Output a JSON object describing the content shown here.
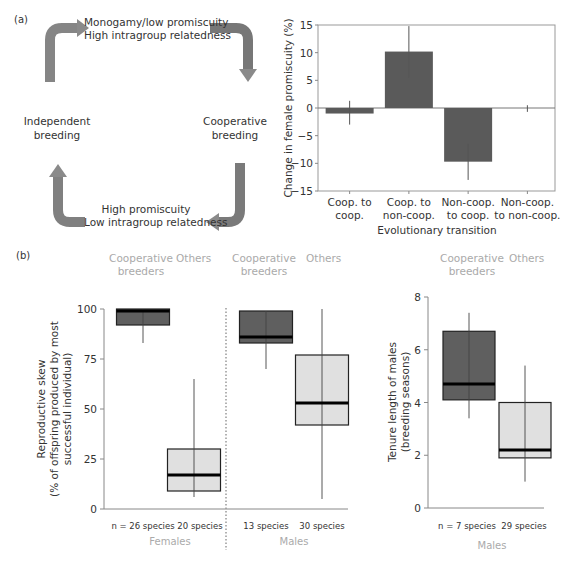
{
  "panel_a": {
    "label": "(a)",
    "diagram": {
      "top_text_line1": "Monogamy/low promiscuity",
      "top_text_line2": "High intragroup relatedness",
      "left_text_line1": "Independent",
      "left_text_line2": "breeding",
      "right_text_line1": "Cooperative",
      "right_text_line2": "breeding",
      "bottom_text_line1": "High promiscuity",
      "bottom_text_line2": "Low intragroup relatedness",
      "arrow_color": "#7f7f7f"
    }
  },
  "panel_b": {
    "label": "(b)",
    "group_headers": {
      "coop_line1": "Cooperative",
      "coop_line2": "breeders",
      "others": "Others"
    },
    "sex_labels": {
      "females": "Females",
      "males": "Males"
    },
    "skew_counts": [
      "n = 26 species",
      "20 species",
      "13 species",
      "30 species"
    ],
    "tenure_counts": [
      "n = 7 species",
      "29 species"
    ]
  },
  "chart_data": [
    {
      "type": "bar",
      "title": "",
      "xlabel": "Evolutionary transition",
      "ylabel": "Change in female promiscuity (%)",
      "categories": [
        "Coop. to coop.",
        "Coop. to non-coop.",
        "Non-coop. to coop.",
        "Non-coop. to non-coop."
      ],
      "category_lines": [
        [
          "Coop. to",
          "coop."
        ],
        [
          "Coop. to",
          "non-coop."
        ],
        [
          "Non-coop.",
          "to coop."
        ],
        [
          "Non-coop.",
          "to non-coop."
        ]
      ],
      "values": [
        -1,
        10.2,
        -9.7,
        0
      ],
      "error_low": [
        -3,
        5.5,
        -13,
        -0.7
      ],
      "error_high": [
        1.3,
        14.8,
        -6.5,
        0.5
      ],
      "ylim": [
        -15,
        15
      ],
      "yticks": [
        15,
        10,
        5,
        0,
        -5,
        -10,
        -15
      ],
      "bar_color": "#5a5a5a"
    },
    {
      "type": "box",
      "title": "",
      "ylabel_line1": "Reproductive skew",
      "ylabel_line2": "(% of offspring produced by most",
      "ylabel_line3": "successful individual)",
      "ylim": [
        0,
        100
      ],
      "yticks": [
        100,
        75,
        50,
        25,
        0
      ],
      "groups": [
        {
          "sex": "Females",
          "category": "Cooperative breeders",
          "n": "n = 26 species",
          "whisker_low": 83,
          "q1": 92,
          "median": 99,
          "q3": 100,
          "whisker_high": 100,
          "color": "#5f5f5f"
        },
        {
          "sex": "Females",
          "category": "Others",
          "n": "20 species",
          "whisker_low": 6,
          "q1": 9,
          "median": 17,
          "q3": 30,
          "whisker_high": 65,
          "color": "#e0e0e0"
        },
        {
          "sex": "Males",
          "category": "Cooperative breeders",
          "n": "13 species",
          "whisker_low": 70,
          "q1": 83,
          "median": 86,
          "q3": 99,
          "whisker_high": 99,
          "color": "#5f5f5f"
        },
        {
          "sex": "Males",
          "category": "Others",
          "n": "30 species",
          "whisker_low": 5,
          "q1": 42,
          "median": 53,
          "q3": 77,
          "whisker_high": 100,
          "color": "#e0e0e0"
        }
      ]
    },
    {
      "type": "box",
      "title": "",
      "ylabel_line1": "Tenure length of males",
      "ylabel_line2": "(breeding seasons)",
      "ylim": [
        0,
        8
      ],
      "yticks": [
        8,
        6,
        4,
        2,
        0
      ],
      "groups": [
        {
          "sex": "Males",
          "category": "Cooperative breeders",
          "n": "n = 7 species",
          "whisker_low": 3.4,
          "q1": 4.1,
          "median": 4.7,
          "q3": 6.7,
          "whisker_high": 7.4,
          "color": "#5f5f5f"
        },
        {
          "sex": "Males",
          "category": "Others",
          "n": "29 species",
          "whisker_low": 1.0,
          "q1": 1.9,
          "median": 2.2,
          "q3": 4.0,
          "whisker_high": 5.4,
          "color": "#e0e0e0"
        }
      ]
    }
  ]
}
